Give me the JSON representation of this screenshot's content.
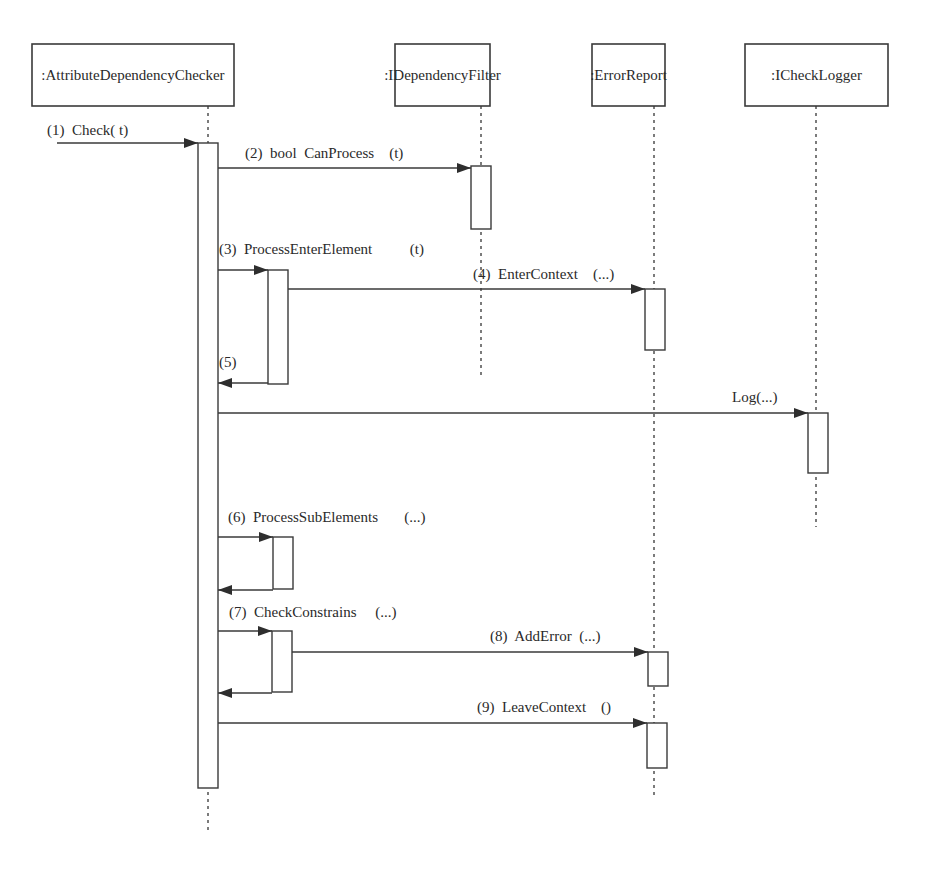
{
  "diagram": {
    "type": "uml-sequence",
    "objects": [
      {
        "id": "checker",
        "label": ":AttributeDependencyChecker",
        "box": [
          32,
          44,
          202,
          62
        ],
        "lifeline_x": 208,
        "lifeline_end": 833
      },
      {
        "id": "filter",
        "label": ":IDependencyFilter",
        "box": [
          395,
          44,
          95,
          62
        ],
        "lifeline_x": 481,
        "lifeline_end": 376
      },
      {
        "id": "error",
        "label": ":ErrorReport",
        "box": [
          592,
          44,
          73,
          62
        ],
        "lifeline_x": 654,
        "lifeline_end": 797
      },
      {
        "id": "logger",
        "label": ":ICheckLogger",
        "box": [
          745,
          44,
          143,
          62
        ],
        "lifeline_x": 816,
        "lifeline_end": 527
      }
    ],
    "activations": [
      {
        "object": "checker",
        "x": 198,
        "y": 143,
        "w": 20,
        "h": 645
      },
      {
        "object": "filter",
        "x": 471,
        "y": 166,
        "w": 20,
        "h": 63
      },
      {
        "object": "checker",
        "x": 268,
        "y": 270,
        "w": 20,
        "h": 114
      },
      {
        "object": "error",
        "x": 645,
        "y": 289,
        "w": 20,
        "h": 61
      },
      {
        "object": "logger",
        "x": 808,
        "y": 413,
        "w": 20,
        "h": 60
      },
      {
        "object": "checker",
        "x": 273,
        "y": 537,
        "w": 20,
        "h": 52
      },
      {
        "object": "checker",
        "x": 272,
        "y": 631,
        "w": 20,
        "h": 61
      },
      {
        "object": "error",
        "x": 648,
        "y": 652,
        "w": 20,
        "h": 34
      },
      {
        "object": "error",
        "x": 647,
        "y": 723,
        "w": 20,
        "h": 45
      }
    ],
    "messages": [
      {
        "num": "(1)",
        "label": "Check( t)",
        "from_x": 57,
        "to_x": 198,
        "y": 143,
        "label_x": 47,
        "label_y": 135,
        "dir": "right"
      },
      {
        "num": "(2)",
        "label": "bool  CanProcess    (t)",
        "from_x": 218,
        "to_x": 471,
        "y": 168,
        "label_x": 245,
        "label_y": 158,
        "dir": "right"
      },
      {
        "num": "(3)",
        "label": "ProcessEnterElement          (t)",
        "from_x": 218,
        "to_x": 268,
        "y": 270,
        "label_x": 219,
        "label_y": 254,
        "dir": "right"
      },
      {
        "num": "(4)",
        "label": "EnterContext    (...)",
        "from_x": 288,
        "to_x": 645,
        "y": 289,
        "label_x": 473,
        "label_y": 279,
        "dir": "right"
      },
      {
        "num": "(5)",
        "label": "",
        "from_x": 268,
        "to_x": 218,
        "y": 383,
        "label_x": 219,
        "label_y": 367,
        "dir": "left"
      },
      {
        "num": "",
        "label": "Log(...)",
        "from_x": 218,
        "to_x": 808,
        "y": 413,
        "label_x": 732,
        "label_y": 402,
        "dir": "right"
      },
      {
        "num": "(6)",
        "label": "ProcessSubElements       (...)",
        "from_x": 218,
        "to_x": 273,
        "y": 537,
        "label_x": 228,
        "label_y": 522,
        "dir": "right"
      },
      {
        "num": "",
        "label": "",
        "from_x": 273,
        "to_x": 218,
        "y": 590,
        "label_x": 0,
        "label_y": 0,
        "dir": "left"
      },
      {
        "num": "(7)",
        "label": "CheckConstrains     (...)",
        "from_x": 218,
        "to_x": 272,
        "y": 631,
        "label_x": 229,
        "label_y": 617,
        "dir": "right"
      },
      {
        "num": "(8)",
        "label": "AddError  (...)",
        "from_x": 292,
        "to_x": 648,
        "y": 652,
        "label_x": 490,
        "label_y": 641,
        "dir": "right"
      },
      {
        "num": "",
        "label": "",
        "from_x": 272,
        "to_x": 218,
        "y": 693,
        "label_x": 0,
        "label_y": 0,
        "dir": "left"
      },
      {
        "num": "(9)",
        "label": "LeaveContext    ()",
        "from_x": 218,
        "to_x": 647,
        "y": 723,
        "label_x": 477,
        "label_y": 712,
        "dir": "right"
      }
    ]
  },
  "colors": {
    "stroke": "#3a3a3a",
    "background": "#ffffff",
    "text": "#2a2a2a"
  }
}
